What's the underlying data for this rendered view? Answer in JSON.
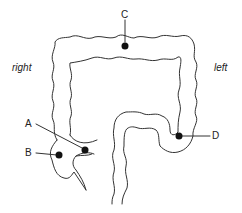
{
  "diagram": {
    "type": "anatomical-diagram",
    "side_labels": {
      "right": "right",
      "left": "left"
    },
    "markers": [
      {
        "id": "A",
        "label": "A"
      },
      {
        "id": "B",
        "label": "B"
      },
      {
        "id": "C",
        "label": "C"
      },
      {
        "id": "D",
        "label": "D"
      }
    ],
    "colors": {
      "outline": "#333333",
      "marker": "#111111",
      "background": "#ffffff"
    }
  }
}
